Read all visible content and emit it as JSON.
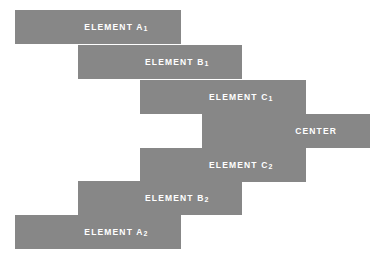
{
  "diagram": {
    "background_color": "#ffffff",
    "bar_color": "#878787",
    "label_color": "#ffffff",
    "bars": [
      {
        "id": "element-a1",
        "label": "ELEMENT A",
        "subscript": "1",
        "x": 15,
        "y": 10,
        "width": 166,
        "height": 34,
        "label_pad_right": 33
      },
      {
        "id": "element-b1",
        "label": "ELEMENT B",
        "subscript": "1",
        "x": 78,
        "y": 45,
        "width": 164,
        "height": 34,
        "label_pad_right": 33
      },
      {
        "id": "element-c1",
        "label": "ELEMENT C",
        "subscript": "1",
        "x": 140,
        "y": 80,
        "width": 166,
        "height": 34,
        "label_pad_right": 33
      },
      {
        "id": "center",
        "label": "CENTER",
        "subscript": "",
        "x": 202,
        "y": 114,
        "width": 168,
        "height": 34,
        "label_pad_right": 33
      },
      {
        "id": "element-c2",
        "label": "ELEMENT C",
        "subscript": "2",
        "x": 140,
        "y": 148,
        "width": 166,
        "height": 34,
        "label_pad_right": 33
      },
      {
        "id": "element-b2",
        "label": "ELEMENT B",
        "subscript": "2",
        "x": 78,
        "y": 181,
        "width": 164,
        "height": 34,
        "label_pad_right": 33
      },
      {
        "id": "element-a2",
        "label": "ELEMENT A",
        "subscript": "2",
        "x": 15,
        "y": 215,
        "width": 166,
        "height": 34,
        "label_pad_right": 33
      }
    ]
  }
}
